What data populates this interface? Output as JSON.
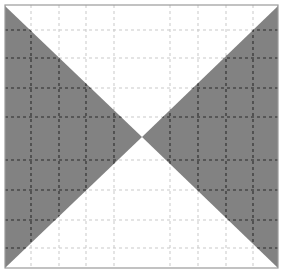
{
  "figure": {
    "width": 283,
    "height": 271,
    "background_color": "#ffffff",
    "frame": {
      "x": 5,
      "y": 5,
      "width": 273,
      "height": 263,
      "stroke_color": "#9a9a9a",
      "stroke_width": 1.2,
      "visible_edges": "top-and-right-faint"
    },
    "shapes": {
      "fill_color": "#828282",
      "left_triangle": {
        "name": "left-gray-triangle",
        "points": "5,6 142,137 5,268"
      },
      "right_triangle": {
        "name": "right-gray-triangle",
        "points": "278,6 142,137 278,268"
      },
      "crossing_point": {
        "x": 142,
        "y": 137
      }
    },
    "gridlines": {
      "dash_pattern": "3 3",
      "dark_dash_color": "#2b2b2b",
      "light_dash_color": "#c9c9c9",
      "horizontal_y": [
        30,
        58,
        88,
        117,
        160,
        190,
        220,
        248
      ],
      "vertical_x": [
        31,
        59,
        86,
        114,
        170,
        198,
        226,
        253
      ],
      "horizontal_count": 8,
      "vertical_count": 8
    }
  },
  "chart_data": {
    "type": "scatter",
    "xlabel": "",
    "ylabel": "",
    "grid": true,
    "legend": "none",
    "xlim": [
      0,
      283
    ],
    "ylim": [
      0,
      271
    ],
    "categories": [],
    "values": [],
    "annotations": [
      "Left gray triangle apex at image center",
      "Right gray triangle apex at image center",
      "8 horizontal dashed gridlines",
      "8 vertical dashed gridlines"
    ]
  }
}
